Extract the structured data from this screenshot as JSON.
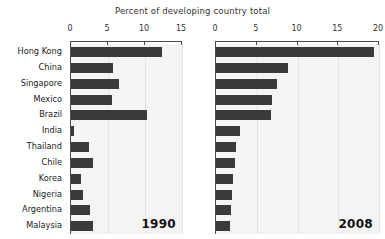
{
  "chart_data": {
    "type": "bar",
    "orientation": "horizontal",
    "title": "Percent of developing country total",
    "xlabel": "",
    "ylabel": "",
    "grid": true,
    "legend": "none",
    "categories": [
      "Hong Kong",
      "China",
      "Singapore",
      "Mexico",
      "Brazil",
      "India",
      "Thailand",
      "Chile",
      "Korea",
      "Nigeria",
      "Argentina",
      "Malaysia"
    ],
    "panels": [
      {
        "name": "1990",
        "label": "1990",
        "xlim": [
          0,
          15
        ],
        "xticks": [
          0,
          5,
          10,
          15
        ],
        "xticklabels": [
          "0",
          "5",
          "10",
          "15"
        ],
        "values": [
          12.3,
          5.7,
          6.5,
          5.6,
          10.3,
          0.4,
          2.4,
          3.0,
          1.4,
          1.6,
          2.6,
          3.0
        ]
      },
      {
        "name": "2008",
        "label": "2008",
        "xlim": [
          0,
          20
        ],
        "xticks": [
          0,
          5,
          10,
          15,
          20
        ],
        "xticklabels": [
          "0",
          "5",
          "10",
          "15",
          "20"
        ],
        "values": [
          19.4,
          8.8,
          7.5,
          6.9,
          6.7,
          2.9,
          2.5,
          2.3,
          2.1,
          2.0,
          1.8,
          1.7
        ]
      }
    ],
    "series": [
      {
        "name": "1990",
        "values": [
          12.3,
          5.7,
          6.5,
          5.6,
          10.3,
          0.4,
          2.4,
          3.0,
          1.4,
          1.6,
          2.6,
          3.0
        ]
      },
      {
        "name": "2008",
        "values": [
          19.4,
          8.8,
          7.5,
          6.9,
          6.7,
          2.9,
          2.5,
          2.3,
          2.1,
          2.0,
          1.8,
          1.7
        ]
      }
    ],
    "colors": {
      "bar": "#3a3a3a",
      "plot_background": "#f4f4f4",
      "figure_background": "#ffffff",
      "axis": "#4a4a4a",
      "gridline": "#e4e4e4",
      "text": "#1a1a1a"
    }
  }
}
